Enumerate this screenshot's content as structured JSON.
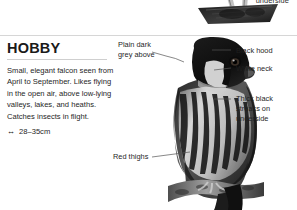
{
  "page": {
    "width": 297,
    "height": 210,
    "background": "#ffffff",
    "divider_color": "#d6d6d6"
  },
  "previous_entry": {
    "label": "underside",
    "photo_alt": "flying-falcon-underside-photo"
  },
  "entry": {
    "title": "HOBBY",
    "description": "Small, elegant falcon seen from April to September. Likes flying in the open air, above low-lying valleys, lakes, and heaths. Catches insects in flight.",
    "size_icon": "↔",
    "size": "28–35cm",
    "photo_alt": "perched-hobby-falcon-photo"
  },
  "annotations": {
    "left": [
      {
        "id": "plain-dark-grey-above",
        "text": "Plain dark\ngrey above"
      },
      {
        "id": "red-thighs",
        "text": "Red thighs"
      }
    ],
    "right": [
      {
        "id": "black-hood",
        "text": "Black hood"
      },
      {
        "id": "white-neck",
        "text": "White neck"
      },
      {
        "id": "thick-black-streaks",
        "text": "Thick black\nstreaks on\nunderside"
      }
    ]
  },
  "colors": {
    "text": "#1f1f1f",
    "title": "#1a1a1a",
    "leader_line": "#555555",
    "rule": "#cfcfcf"
  }
}
